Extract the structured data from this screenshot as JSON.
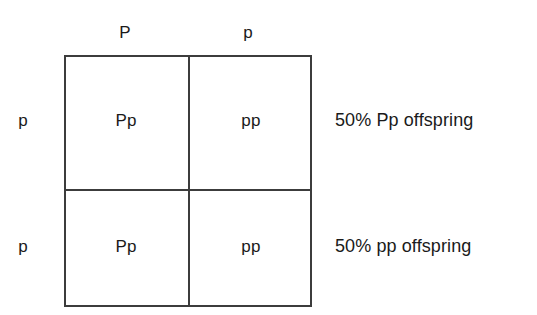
{
  "diagram": {
    "type": "punnett-square",
    "line_color": "#3c3c3c",
    "text_color": "#1a1a1a",
    "background_color": "#ffffff",
    "column_alleles": [
      {
        "label": "P"
      },
      {
        "label": "p"
      }
    ],
    "row_alleles": [
      {
        "label": "p"
      },
      {
        "label": "p"
      }
    ],
    "cells": [
      [
        {
          "genotype": "Pp"
        },
        {
          "genotype": "pp"
        }
      ],
      [
        {
          "genotype": "Pp"
        },
        {
          "genotype": "pp"
        }
      ]
    ],
    "annotations": [
      {
        "text": "50% Pp offspring"
      },
      {
        "text": "50% pp offspring"
      }
    ]
  }
}
